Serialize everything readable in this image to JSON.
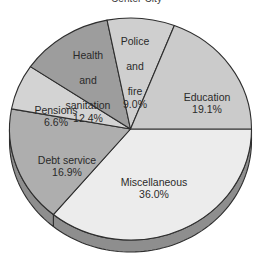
{
  "chart_data": {
    "type": "pie",
    "title": "Center City",
    "title_truncated": true,
    "categories": [
      "Miscellaneous",
      "Debt service",
      "Pensions",
      "Health and sanitation",
      "Police and fire",
      "Education"
    ],
    "values": [
      36.0,
      16.9,
      6.6,
      12.4,
      9.0,
      19.1
    ],
    "value_suffix": "%",
    "xlabel": "",
    "ylabel": "",
    "legend": "none",
    "grid": false,
    "style": "3d-pie",
    "slices": [
      {
        "name": "miscellaneous",
        "label": "Miscellaneous",
        "value": 36.0,
        "value_text": "36.0%",
        "color": "#ececec",
        "start_deg": 0,
        "sweep_deg": 129.6
      },
      {
        "name": "debt-service",
        "label": "Debt service",
        "value": 16.9,
        "value_text": "16.9%",
        "color": "#aeaeae",
        "start_deg": 129.6,
        "sweep_deg": 60.84
      },
      {
        "name": "pensions",
        "label": "Pensions",
        "value": 6.6,
        "value_text": "6.6%",
        "color": "#d3d3d3",
        "start_deg": 190.44,
        "sweep_deg": 23.76
      },
      {
        "name": "health-and-sanitation",
        "label": "Health and sanitation",
        "value": 12.4,
        "value_text": "12.4%",
        "color": "#9d9d9d",
        "start_deg": 214.2,
        "sweep_deg": 44.64
      },
      {
        "name": "police-and-fire",
        "label": "Police and fire",
        "value": 9.0,
        "value_text": "9.0%",
        "color": "#cfcfcf",
        "start_deg": 258.84,
        "sweep_deg": 32.4
      },
      {
        "name": "education",
        "label": "Education",
        "value": 19.1,
        "value_text": "19.1%",
        "color": "#cbcbcb",
        "start_deg": 291.24,
        "sweep_deg": 68.76
      }
    ],
    "geometry": {
      "cx": 130.5,
      "cy": 129,
      "rx": 121,
      "ry": 111,
      "depth": 12
    },
    "colors": {
      "outline": "#2e2e2e",
      "side_wall": "#8e8e8e",
      "background": "#ffffff",
      "text": "#2a2a2a"
    }
  },
  "labels": {
    "police": {
      "line1": "Police",
      "line2": "and",
      "line3": "fire",
      "pct": "9.0%"
    },
    "education": {
      "line1": "Education",
      "pct": "19.1%"
    },
    "health": {
      "line1": "Health",
      "line2": "and",
      "line3": "sanitation",
      "pct": "12.4%"
    },
    "pensions": {
      "line1": "Pensions",
      "pct": "6.6%"
    },
    "debt": {
      "line1": "Debt service",
      "pct": "16.9%"
    },
    "misc": {
      "line1": "Miscellaneous",
      "pct": "36.0%"
    }
  }
}
